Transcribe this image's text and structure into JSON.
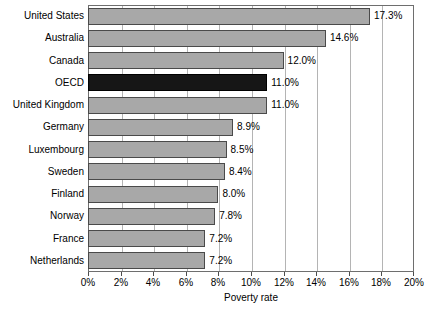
{
  "chart_data": {
    "type": "bar",
    "orientation": "horizontal",
    "title": "",
    "xlabel": "Poverty rate",
    "ylabel": "",
    "xlim": [
      0,
      20
    ],
    "xtick_labels": [
      "0%",
      "2%",
      "4%",
      "6%",
      "8%",
      "10%",
      "12%",
      "14%",
      "16%",
      "18%",
      "20%"
    ],
    "xtick_values": [
      0,
      2,
      4,
      6,
      8,
      10,
      12,
      14,
      16,
      18,
      20
    ],
    "grid": "vertical",
    "legend": "none",
    "categories": [
      "United States",
      "Australia",
      "Canada",
      "OECD",
      "United Kingdom",
      "Germany",
      "Luxembourg",
      "Sweden",
      "Finland",
      "Norway",
      "France",
      "Netherlands"
    ],
    "values": [
      17.3,
      14.6,
      12.0,
      11.0,
      11.0,
      8.9,
      8.5,
      8.4,
      8.0,
      7.8,
      7.2,
      7.2
    ],
    "value_labels": [
      "17.3%",
      "14.6%",
      "12.0%",
      "11.0%",
      "11.0%",
      "8.9%",
      "8.5%",
      "8.4%",
      "8.0%",
      "7.8%",
      "7.2%",
      "7.2%"
    ],
    "highlight_category": "OECD",
    "colors": {
      "bar": "#a8a8a8",
      "bar_edge": "#4a4a4a",
      "highlight_bar": "#161616",
      "gridline": "#b4b4b4",
      "axis": "#6e6e6e",
      "text": "#000000",
      "background": "#ffffff"
    }
  }
}
